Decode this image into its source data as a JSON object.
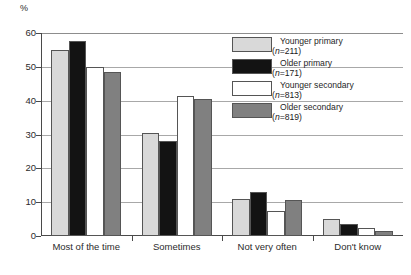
{
  "chart_data": {
    "type": "bar",
    "title": "",
    "subtitle": "",
    "xlabel": "",
    "ylabel": "%",
    "ylim": [
      0,
      60
    ],
    "yticks": [
      0,
      10,
      20,
      30,
      40,
      50,
      60
    ],
    "ytick_labels": [
      "0",
      "10",
      "20",
      "30",
      "40",
      "50",
      "60"
    ],
    "grid": true,
    "legend_position": "upper right",
    "categories": [
      "Most of the time",
      "Sometimes",
      "Not very often",
      "Don't know"
    ],
    "series": [
      {
        "name": "Younger primary",
        "n_label": "(n=211)",
        "n": 211,
        "color": "#d9d9d9",
        "values": [
          55,
          30.5,
          11,
          5
        ]
      },
      {
        "name": "Older primary",
        "n_label": "(n=171)",
        "n": 171,
        "color": "#131313",
        "values": [
          57.5,
          28,
          13,
          3.5
        ]
      },
      {
        "name": "Younger secondary",
        "n_label": "(n=813)",
        "n": 813,
        "color": "#ffffff",
        "values": [
          50,
          41.5,
          7.5,
          2.5
        ]
      },
      {
        "name": "Older secondary",
        "n_label": "(n=819)",
        "n": 819,
        "color": "#808080",
        "values": [
          48.5,
          40.5,
          10.5,
          1.5
        ]
      }
    ]
  },
  "axes": {
    "y_unit": "%"
  },
  "colors": {
    "axis": "#4a4a4a",
    "gridline": "#a8a8a8",
    "bar_outline": "#555555",
    "text": "#1f1f1f",
    "background": "#ffffff"
  }
}
